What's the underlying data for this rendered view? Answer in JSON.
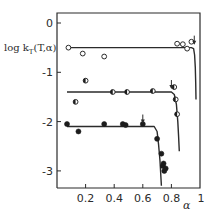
{
  "chart_data": {
    "type": "scatter",
    "title": "",
    "xlabel": "α",
    "ylabel": "log k_T(T,α)",
    "xlim": [
      0,
      1
    ],
    "ylim": [
      -3.35,
      0.2
    ],
    "grid": false,
    "legend": null,
    "x_ticks": [
      {
        "value": 0.2,
        "label": "0.2"
      },
      {
        "value": 0.4,
        "label": "0.4"
      },
      {
        "value": 0.6,
        "label": "0.6"
      },
      {
        "value": 0.8,
        "label": "0.8"
      },
      {
        "value": 1.0,
        "label": "1"
      }
    ],
    "y_ticks": [
      {
        "value": 0,
        "label": "0"
      },
      {
        "value": -1,
        "label": "-1"
      },
      {
        "value": -2,
        "label": "-2"
      },
      {
        "value": -3,
        "label": "-3"
      }
    ],
    "series": [
      {
        "name": "open circles",
        "marker": "open",
        "points": [
          [
            0.08,
            -0.5
          ],
          [
            0.18,
            -0.62
          ],
          [
            0.33,
            -0.68
          ],
          [
            0.84,
            -0.42
          ],
          [
            0.88,
            -0.43
          ],
          [
            0.91,
            -0.52
          ],
          [
            0.94,
            -0.38
          ]
        ],
        "fit_curve": [
          [
            0.08,
            -0.5
          ],
          [
            0.94,
            -0.5
          ],
          [
            0.955,
            -0.52
          ],
          [
            0.962,
            -0.65
          ],
          [
            0.967,
            -0.9
          ],
          [
            0.97,
            -1.2
          ],
          [
            0.972,
            -1.55
          ]
        ],
        "arrow_at": 0.96
      },
      {
        "name": "half-filled circles",
        "marker": "half",
        "points": [
          [
            0.13,
            -1.6
          ],
          [
            0.2,
            -1.17
          ],
          [
            0.39,
            -1.4
          ],
          [
            0.49,
            -1.4
          ],
          [
            0.67,
            -1.38
          ],
          [
            0.82,
            -1.3
          ],
          [
            0.83,
            -1.55
          ],
          [
            0.84,
            -1.85
          ]
        ],
        "fit_curve": [
          [
            0.07,
            -1.4
          ],
          [
            0.8,
            -1.4
          ],
          [
            0.82,
            -1.45
          ],
          [
            0.835,
            -1.65
          ],
          [
            0.845,
            -2.0
          ],
          [
            0.85,
            -2.3
          ],
          [
            0.855,
            -2.6
          ]
        ],
        "arrow_at": 0.8
      },
      {
        "name": "filled circles",
        "marker": "filled",
        "points": [
          [
            0.07,
            -2.05
          ],
          [
            0.15,
            -2.2
          ],
          [
            0.33,
            -2.05
          ],
          [
            0.46,
            -2.05
          ],
          [
            0.48,
            -2.07
          ],
          [
            0.6,
            -2.05
          ],
          [
            0.7,
            -2.35
          ],
          [
            0.73,
            -2.65
          ],
          [
            0.74,
            -2.9
          ],
          [
            0.75,
            -3.0
          ],
          [
            0.76,
            -2.95
          ],
          [
            0.745,
            -2.85
          ]
        ],
        "fit_curve": [
          [
            0.07,
            -2.1
          ],
          [
            0.68,
            -2.1
          ],
          [
            0.7,
            -2.2
          ],
          [
            0.71,
            -2.45
          ],
          [
            0.72,
            -2.8
          ],
          [
            0.73,
            -3.3
          ]
        ],
        "arrow_at": 0.6
      }
    ]
  }
}
